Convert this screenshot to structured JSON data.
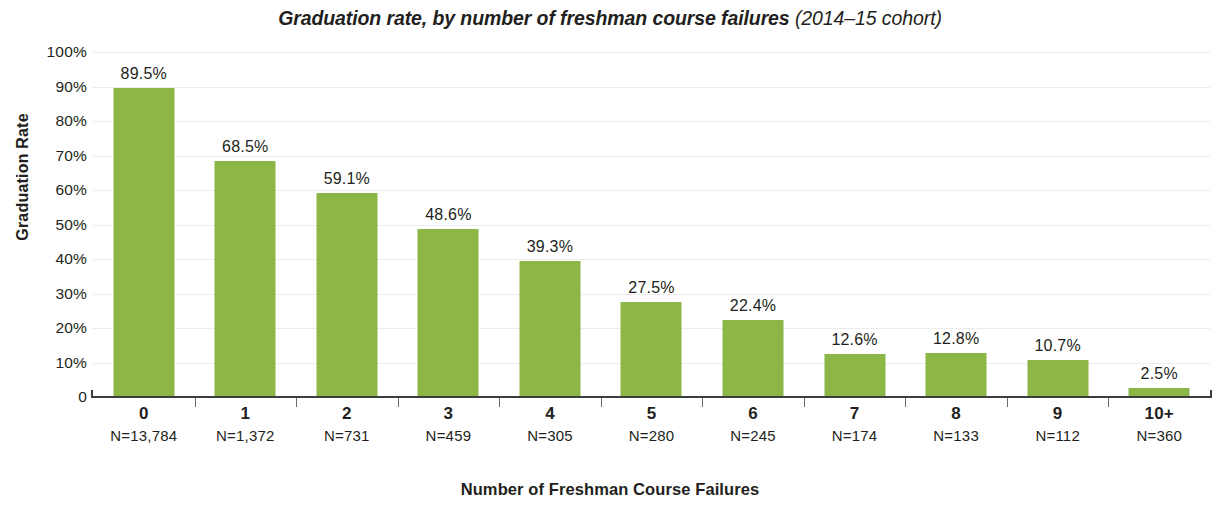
{
  "chart_data": {
    "type": "bar",
    "title": "Graduation rate, by number of freshman course failures (2014–15 cohort)",
    "title_main": "Graduation rate, by number of freshman course failures",
    "title_sub": " (2014–15 cohort)",
    "xlabel": "Number of Freshman Course Failures",
    "ylabel": "Graduation Rate",
    "categories": [
      "0",
      "1",
      "2",
      "3",
      "4",
      "5",
      "6",
      "7",
      "8",
      "9",
      "10+"
    ],
    "values": [
      89.5,
      68.5,
      59.1,
      48.6,
      39.3,
      27.5,
      22.4,
      12.6,
      12.8,
      10.7,
      2.5
    ],
    "value_labels": [
      "89.5%",
      "68.5%",
      "59.1%",
      "48.6%",
      "39.3%",
      "27.5%",
      "22.4%",
      "12.6%",
      "12.8%",
      "10.7%",
      "2.5%"
    ],
    "group_sizes": [
      "N=13,784",
      "N=1,372",
      "N=731",
      "N=459",
      "N=305",
      "N=280",
      "N=245",
      "N=174",
      "N=133",
      "N=112",
      "N=360"
    ],
    "ylim": [
      0,
      100
    ],
    "ytick_values": [
      100,
      90,
      80,
      70,
      60,
      50,
      40,
      30,
      20,
      10,
      0
    ],
    "ytick_labels": [
      "100%",
      "90%",
      "80%",
      "70%",
      "60%",
      "50%",
      "40%",
      "30%",
      "20%",
      "10%",
      "0"
    ],
    "grid": true,
    "legend": false,
    "bar_color": "#8cb646",
    "grid_color": "#ececec",
    "axis_color": "#3d3d3d",
    "text_color": "#231f20"
  }
}
